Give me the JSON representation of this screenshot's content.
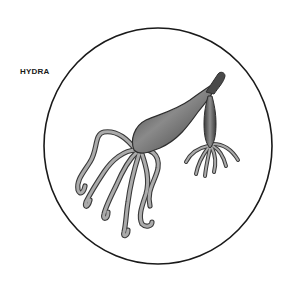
{
  "figure": {
    "label": "HYDRA",
    "frame": "circle",
    "colors": {
      "background": "#ffffff",
      "outline": "#1a1a1a",
      "body_dark": "#4a4a4a",
      "body_mid": "#7a7a7a",
      "tentacle_fill": "#a8a8a8",
      "tentacle_edge": "#3a3a3a"
    }
  }
}
